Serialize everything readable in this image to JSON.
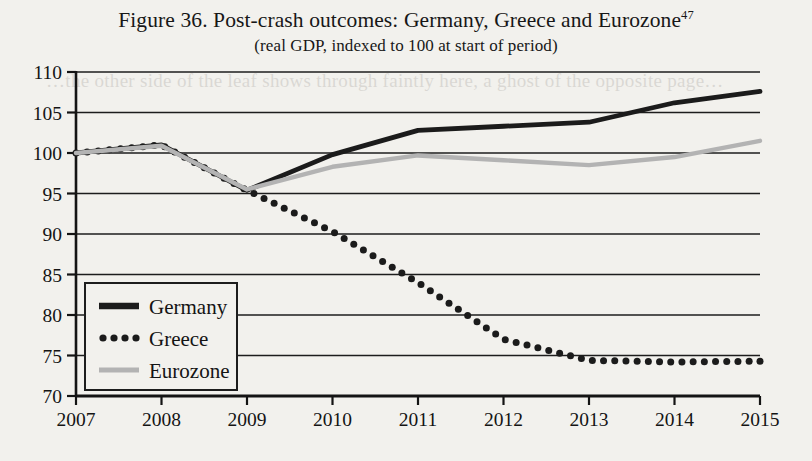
{
  "figure": {
    "title_main": "Figure 36. Post-crash outcomes: Germany, Greece and Eurozone",
    "title_footnote": "47",
    "title_sub": "(real GDP, indexed to 100 at start of period)"
  },
  "page_bleed_text": "…the other side of the leaf shows through faintly here, a ghost of the opposite page…",
  "chart_data": {
    "type": "line",
    "title": "Figure 36. Post-crash outcomes: Germany, Greece and Eurozone",
    "subtitle": "(real GDP, indexed to 100 at start of period)",
    "xlabel": "",
    "ylabel": "",
    "x": [
      2007,
      2008,
      2009,
      2010,
      2011,
      2012,
      2013,
      2014,
      2015
    ],
    "categories": [
      "2007",
      "2008",
      "2009",
      "2010",
      "2011",
      "2012",
      "2013",
      "2014",
      "2015"
    ],
    "xlim": [
      2007,
      2015
    ],
    "ylim": [
      70,
      110
    ],
    "yticks": [
      70,
      75,
      80,
      85,
      90,
      95,
      100,
      105,
      110
    ],
    "ytick_labels": [
      "70",
      "75",
      "80",
      "85",
      "90",
      "95",
      "100",
      "105",
      "110"
    ],
    "xticks": [
      2007,
      2008,
      2009,
      2010,
      2011,
      2012,
      2013,
      2014,
      2015
    ],
    "xtick_labels": [
      "2007",
      "2008",
      "2009",
      "2010",
      "2011",
      "2012",
      "2013",
      "2014",
      "2015"
    ],
    "grid": "horizontal",
    "legend_position": "lower-left",
    "series": [
      {
        "name": "Germany",
        "style": "solid-thick",
        "color": "#1b1b1b",
        "values": [
          100.0,
          101.0,
          95.4,
          99.8,
          102.8,
          103.3,
          103.8,
          106.2,
          107.6
        ]
      },
      {
        "name": "Greece",
        "style": "dotted",
        "color": "#1b1b1b",
        "values": [
          100.0,
          101.0,
          95.4,
          90.3,
          84.0,
          77.0,
          74.4,
          74.2,
          74.3
        ]
      },
      {
        "name": "Eurozone",
        "style": "solid-light",
        "color": "#b3b3b3",
        "values": [
          100.0,
          100.9,
          95.5,
          98.3,
          99.7,
          99.1,
          98.5,
          99.5,
          101.5
        ]
      }
    ]
  },
  "legend": {
    "items": [
      {
        "label": "Germany",
        "swatch": "solid-thick-swatch"
      },
      {
        "label": "Greece",
        "swatch": "dotted-swatch"
      },
      {
        "label": "Eurozone",
        "swatch": "solid-light-swatch"
      }
    ]
  }
}
